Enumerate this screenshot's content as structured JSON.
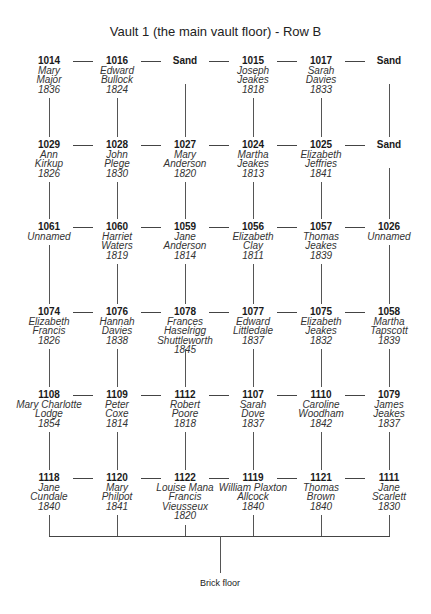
{
  "title": "Vault 1 (the main vault floor) - Row B",
  "columns_x": [
    49,
    117,
    185,
    253,
    321,
    389
  ],
  "rows": [
    {
      "y": 56,
      "nodes": [
        {
          "num": "1014",
          "name_lines": [
            "Mary",
            "Major"
          ],
          "year": "1836"
        },
        {
          "num": "1016",
          "name_lines": [
            "Edward",
            "Bullock"
          ],
          "year": "1824"
        },
        {
          "num": "Sand",
          "name_lines": [],
          "year": ""
        },
        {
          "num": "1015",
          "name_lines": [
            "Joseph",
            "Jeakes"
          ],
          "year": "1818"
        },
        {
          "num": "1017",
          "name_lines": [
            "Sarah",
            "Davies"
          ],
          "year": "1833"
        },
        {
          "num": "Sand",
          "name_lines": [],
          "year": ""
        }
      ]
    },
    {
      "y": 140,
      "nodes": [
        {
          "num": "1029",
          "name_lines": [
            "Ann",
            "Kirkup"
          ],
          "year": "1826"
        },
        {
          "num": "1028",
          "name_lines": [
            "John",
            "Plege"
          ],
          "year": "1830"
        },
        {
          "num": "1027",
          "name_lines": [
            "Mary",
            "Anderson"
          ],
          "year": "1820"
        },
        {
          "num": "1024",
          "name_lines": [
            "Martha",
            "Jeakes"
          ],
          "year": "1813"
        },
        {
          "num": "1025",
          "name_lines": [
            "Elizabeth",
            "Jeffries"
          ],
          "year": "1841"
        },
        {
          "num": "Sand",
          "name_lines": [],
          "year": ""
        }
      ]
    },
    {
      "y": 222,
      "nodes": [
        {
          "num": "1061",
          "name_lines": [
            "Unnamed"
          ],
          "year": ""
        },
        {
          "num": "1060",
          "name_lines": [
            "Harriet",
            "Waters"
          ],
          "year": "1819"
        },
        {
          "num": "1059",
          "name_lines": [
            "Jane",
            "Anderson"
          ],
          "year": "1814"
        },
        {
          "num": "1056",
          "name_lines": [
            "Elizabeth",
            "Clay"
          ],
          "year": "1811"
        },
        {
          "num": "1057",
          "name_lines": [
            "Thomas",
            "Jeakes"
          ],
          "year": "1839"
        },
        {
          "num": "1026",
          "name_lines": [
            "Unnamed"
          ],
          "year": ""
        }
      ]
    },
    {
      "y": 307,
      "nodes": [
        {
          "num": "1074",
          "name_lines": [
            "Elizabeth",
            "Francis"
          ],
          "year": "1826"
        },
        {
          "num": "1076",
          "name_lines": [
            "Hannah",
            "Davies"
          ],
          "year": "1838"
        },
        {
          "num": "1078",
          "name_lines": [
            "Frances Haselrigg",
            "Shuttleworth"
          ],
          "year": "1845"
        },
        {
          "num": "1077",
          "name_lines": [
            "Edward",
            "Littledale"
          ],
          "year": "1837"
        },
        {
          "num": "1075",
          "name_lines": [
            "Elizabeth",
            "Jeakes"
          ],
          "year": "1832"
        },
        {
          "num": "1058",
          "name_lines": [
            "Martha",
            "Tapscott"
          ],
          "year": "1839"
        }
      ]
    },
    {
      "y": 390,
      "nodes": [
        {
          "num": "1108",
          "name_lines": [
            "Mary Charlotte",
            "Lodge"
          ],
          "year": "1854"
        },
        {
          "num": "1109",
          "name_lines": [
            "Peter",
            "Coxe"
          ],
          "year": "1814"
        },
        {
          "num": "1112",
          "name_lines": [
            "Robert",
            "Poore"
          ],
          "year": "1818"
        },
        {
          "num": "1107",
          "name_lines": [
            "Sarah",
            "Dove"
          ],
          "year": "1837"
        },
        {
          "num": "1110",
          "name_lines": [
            "Caroline",
            "Woodham"
          ],
          "year": "1842"
        },
        {
          "num": "1079",
          "name_lines": [
            "James",
            "Jeakes"
          ],
          "year": "1837"
        }
      ]
    },
    {
      "y": 473,
      "nodes": [
        {
          "num": "1118",
          "name_lines": [
            "Jane",
            "Cundale"
          ],
          "year": "1840"
        },
        {
          "num": "1120",
          "name_lines": [
            "Mary",
            "Philpot"
          ],
          "year": "1841"
        },
        {
          "num": "1122",
          "name_lines": [
            "Louise Mana",
            "Francis",
            "Vieusseux"
          ],
          "year": "1820"
        },
        {
          "num": "1119",
          "name_lines": [
            "William Plaxton",
            "Allcock"
          ],
          "year": "1840"
        },
        {
          "num": "1121",
          "name_lines": [
            "Thomas",
            "Brown"
          ],
          "year": "1840"
        },
        {
          "num": "1111",
          "name_lines": [
            "Jane",
            "Scarlett"
          ],
          "year": "1830"
        }
      ]
    }
  ],
  "floor": {
    "label": "Brick floor",
    "line_y": 536,
    "label_y": 578
  },
  "colors": {
    "line": "#555555",
    "text": "#1a1a1a"
  }
}
